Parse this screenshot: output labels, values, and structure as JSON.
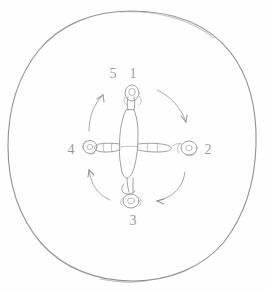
{
  "image": {
    "title": "Hand-drawn pencil sketch",
    "subject": "Figure in a circle with rotation arrows",
    "background_color": "#fefefe",
    "pencil_color": "#95959b",
    "width": 267,
    "height": 292
  },
  "diagram": {
    "outer_circle": {
      "name": "circle",
      "center_x": 131,
      "center_y": 146,
      "radius_x": 125,
      "radius_y": 135,
      "stroke_color": "#8a8a90"
    },
    "center_figure": {
      "name": "cross-figure",
      "description": "cross shaped figure with four limbs"
    },
    "labels": [
      {
        "id": "label-5",
        "text": "5",
        "x": 113,
        "y": 74,
        "position": "top-left"
      },
      {
        "id": "label-1",
        "text": "1",
        "x": 133,
        "y": 74,
        "position": "top-right"
      },
      {
        "id": "label-2",
        "text": "2",
        "x": 208,
        "y": 150,
        "position": "right"
      },
      {
        "id": "label-3",
        "text": "3",
        "x": 133,
        "y": 221,
        "position": "bottom"
      },
      {
        "id": "label-4",
        "text": "4",
        "x": 71,
        "y": 150,
        "position": "left"
      }
    ],
    "arrows": [
      {
        "id": "arrow-top-left",
        "direction": "counter-clockwise",
        "points_to": "5"
      },
      {
        "id": "arrow-top-right",
        "direction": "clockwise",
        "points_to": "2"
      },
      {
        "id": "arrow-bottom-right",
        "direction": "clockwise",
        "points_to": "3"
      },
      {
        "id": "arrow-bottom-left",
        "direction": "counter-clockwise",
        "points_to": "4"
      }
    ]
  }
}
